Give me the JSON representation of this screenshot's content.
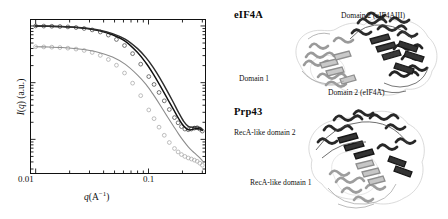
{
  "chart_data": {
    "type": "line",
    "title": "",
    "xlabel": "q(A⁻¹)",
    "ylabel": "I(q) (a.u.)",
    "xscale": "log",
    "yscale": "log",
    "xlim": [
      0.009,
      0.32
    ],
    "ylim": [
      0.0025,
      1.3
    ],
    "grid": false,
    "legend": "none",
    "xticks": [
      0.01,
      0.1
    ],
    "xtick_labels": [
      "0.01",
      "0.1"
    ],
    "yticks": [],
    "ytick_labels": [],
    "series": [
      {
        "name": "eIF4A experimental data",
        "style": "open-circles",
        "color": "#4a4a4a",
        "x": [
          0.01,
          0.0118,
          0.0139,
          0.0164,
          0.0193,
          0.0228,
          0.0269,
          0.0317,
          0.0374,
          0.0441,
          0.052,
          0.0613,
          0.0723,
          0.0853,
          0.1006,
          0.112,
          0.124,
          0.138,
          0.153,
          0.17,
          0.183,
          0.196,
          0.21,
          0.225,
          0.24,
          0.255,
          0.27,
          0.285,
          0.3
        ],
        "y": [
          1.0,
          0.995,
          0.988,
          0.978,
          0.962,
          0.938,
          0.902,
          0.852,
          0.782,
          0.69,
          0.578,
          0.452,
          0.325,
          0.212,
          0.128,
          0.093,
          0.0672,
          0.0478,
          0.0336,
          0.0242,
          0.0196,
          0.0168,
          0.0152,
          0.0148,
          0.0152,
          0.0158,
          0.016,
          0.0152,
          0.014
        ]
      },
      {
        "name": "eIF4A model fit",
        "style": "solid-line",
        "color": "#111111",
        "x": [
          0.01,
          0.013,
          0.017,
          0.022,
          0.0285,
          0.037,
          0.048,
          0.062,
          0.08,
          0.095,
          0.11,
          0.127,
          0.145,
          0.165,
          0.185,
          0.205,
          0.225,
          0.245,
          0.265,
          0.285,
          0.3
        ],
        "y": [
          1.0,
          0.99,
          0.974,
          0.946,
          0.898,
          0.82,
          0.7,
          0.54,
          0.34,
          0.222,
          0.143,
          0.088,
          0.0548,
          0.0348,
          0.0232,
          0.0172,
          0.0148,
          0.015,
          0.0156,
          0.0152,
          0.0144
        ]
      },
      {
        "name": "eIF4AIII model fit",
        "style": "solid-line",
        "color": "#2d2d2d",
        "x": [
          0.01,
          0.013,
          0.017,
          0.022,
          0.0285,
          0.037,
          0.048,
          0.062,
          0.08,
          0.095,
          0.11,
          0.127,
          0.145,
          0.165,
          0.185,
          0.205,
          0.225,
          0.245,
          0.265,
          0.285,
          0.3
        ],
        "y": [
          1.0,
          0.992,
          0.978,
          0.954,
          0.912,
          0.842,
          0.734,
          0.586,
          0.398,
          0.276,
          0.186,
          0.118,
          0.074,
          0.046,
          0.0296,
          0.0208,
          0.017,
          0.0164,
          0.0166,
          0.016,
          0.015
        ]
      },
      {
        "name": "Prp43 experimental data",
        "style": "open-circles",
        "color": "#a8a8a8",
        "x": [
          0.01,
          0.0118,
          0.0139,
          0.0164,
          0.0193,
          0.0228,
          0.0269,
          0.0317,
          0.0374,
          0.0441,
          0.052,
          0.0613,
          0.0723,
          0.0853,
          0.1006,
          0.112,
          0.124,
          0.138,
          0.153,
          0.17,
          0.183,
          0.196,
          0.21,
          0.225,
          0.24,
          0.255,
          0.27,
          0.285,
          0.3
        ],
        "y": [
          0.43,
          0.427,
          0.423,
          0.416,
          0.406,
          0.391,
          0.37,
          0.341,
          0.303,
          0.256,
          0.203,
          0.148,
          0.098,
          0.059,
          0.033,
          0.0232,
          0.0164,
          0.0118,
          0.0088,
          0.0069,
          0.006,
          0.0054,
          0.005,
          0.0047,
          0.0045,
          0.0043,
          0.0041,
          0.0038,
          0.0035
        ]
      },
      {
        "name": "Prp43 model fit",
        "style": "solid-line",
        "color": "#8c8c8c",
        "x": [
          0.01,
          0.013,
          0.017,
          0.022,
          0.0285,
          0.037,
          0.048,
          0.062,
          0.08,
          0.095,
          0.11,
          0.127,
          0.145,
          0.165,
          0.185,
          0.205,
          0.225,
          0.245,
          0.265,
          0.285,
          0.3
        ],
        "y": [
          0.43,
          0.425,
          0.416,
          0.401,
          0.376,
          0.338,
          0.283,
          0.212,
          0.136,
          0.093,
          0.062,
          0.04,
          0.0262,
          0.0176,
          0.0124,
          0.0093,
          0.0074,
          0.0062,
          0.0054,
          0.0047,
          0.0042
        ]
      }
    ]
  },
  "chart": {
    "xlabel": "q(A⁻¹)",
    "ylabel": "I(q) (a.u.)",
    "xtick_labels": [
      "0.01",
      "0.1"
    ]
  },
  "structures": {
    "panels": [
      {
        "title": "eIF4A",
        "labels": [
          "Domain 2 (eIF4AIII)",
          "Domain 1",
          "Domain 2 (eIF4A)"
        ]
      },
      {
        "title": "Prp43",
        "labels": [
          "RecA-like domain 2",
          "RecA-like domain 1"
        ]
      }
    ]
  },
  "colors": {
    "background": "#ffffff",
    "axis": "#111111",
    "dark_curve": "#111111",
    "mid_curve": "#2d2d2d",
    "light_curve": "#8c8c8c",
    "marker_dark": "#4a4a4a",
    "marker_light": "#a8a8a8",
    "ribbon_dark": "#2b2b2b",
    "ribbon_light": "#b5b5b5"
  }
}
